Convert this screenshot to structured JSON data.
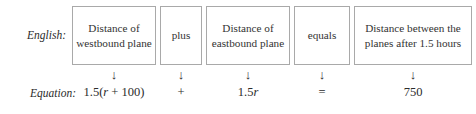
{
  "figure": {
    "rows": {
      "english_label": "English:",
      "equation_label": "Equation:"
    },
    "arrow_glyph": "↓",
    "columns": [
      {
        "phrase": "Distance of westbound plane",
        "arrow": "↓",
        "term_prefix": "1.5(",
        "term_variable": "r",
        "term_suffix": " + 100)",
        "term_plain": "1.5(r + 100)"
      },
      {
        "phrase": "plus",
        "arrow": "↓",
        "term_prefix": "+",
        "term_variable": "",
        "term_suffix": "",
        "term_plain": "+"
      },
      {
        "phrase": "Distance of eastbound plane",
        "arrow": "↓",
        "term_prefix": "1.5",
        "term_variable": "r",
        "term_suffix": "",
        "term_plain": "1.5r"
      },
      {
        "phrase": "equals",
        "arrow": "↓",
        "term_prefix": "=",
        "term_variable": "",
        "term_suffix": "",
        "term_plain": "="
      },
      {
        "phrase": "Distance between the planes after 1.5 hours",
        "arrow": "↓",
        "term_prefix": "750",
        "term_variable": "",
        "term_suffix": "",
        "term_plain": "750"
      }
    ],
    "colors": {
      "box_border": "#a9a9a9",
      "text": "#2b2b2b",
      "background": "#ffffff"
    }
  }
}
